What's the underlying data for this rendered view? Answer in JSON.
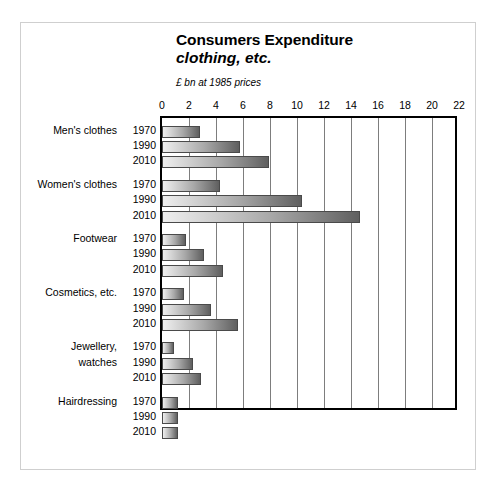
{
  "chart_data": {
    "type": "bar",
    "orientation": "horizontal",
    "title": "Consumers Expenditure",
    "subtitle": "clothing, etc.",
    "units_note": "£ bn at 1985 prices",
    "xlabel": "",
    "ylabel": "",
    "xlim": [
      0,
      22
    ],
    "xticks": [
      0,
      2,
      4,
      6,
      8,
      10,
      12,
      14,
      16,
      18,
      20,
      22
    ],
    "grid": "vertical",
    "legend": "none",
    "series_key": "year",
    "years": [
      "1970",
      "1990",
      "2010"
    ],
    "groups": [
      {
        "category": "Men's clothes",
        "category_lines": [
          "Men's clothes"
        ],
        "bars": [
          {
            "year": "1970",
            "value": 2.8
          },
          {
            "year": "1990",
            "value": 5.8
          },
          {
            "year": "2010",
            "value": 7.9
          }
        ]
      },
      {
        "category": "Women's clothes",
        "category_lines": [
          "Women's clothes"
        ],
        "bars": [
          {
            "year": "1970",
            "value": 4.3
          },
          {
            "year": "1990",
            "value": 10.4
          },
          {
            "year": "2010",
            "value": 14.7
          }
        ]
      },
      {
        "category": "Footwear",
        "category_lines": [
          "Footwear"
        ],
        "bars": [
          {
            "year": "1970",
            "value": 1.8
          },
          {
            "year": "1990",
            "value": 3.1
          },
          {
            "year": "2010",
            "value": 4.5
          }
        ]
      },
      {
        "category": "Cosmetics, etc.",
        "category_lines": [
          "Cosmetics, etc."
        ],
        "bars": [
          {
            "year": "1970",
            "value": 1.6
          },
          {
            "year": "1990",
            "value": 3.6
          },
          {
            "year": "2010",
            "value": 5.6
          }
        ]
      },
      {
        "category": "Jewellery, watches",
        "category_lines": [
          "Jewellery,",
          "watches"
        ],
        "bars": [
          {
            "year": "1970",
            "value": 0.9
          },
          {
            "year": "1990",
            "value": 2.3
          },
          {
            "year": "2010",
            "value": 2.9
          }
        ]
      },
      {
        "category": "Hairdressing",
        "category_lines": [
          "Hairdressing"
        ],
        "bars": [
          {
            "year": "1970",
            "value": 1.2
          },
          {
            "year": "1990",
            "value": 1.2
          },
          {
            "year": "2010",
            "value": 1.2
          }
        ]
      }
    ]
  },
  "colors": {
    "bar_light": "#efefef",
    "bar_dark": "#5f5f5f",
    "bar_border": "#4a4a4a",
    "axis": "#000000",
    "gridline": "#7d7d7d",
    "frame": "#cfcfcf",
    "background": "#ffffff",
    "text": "#000000"
  }
}
